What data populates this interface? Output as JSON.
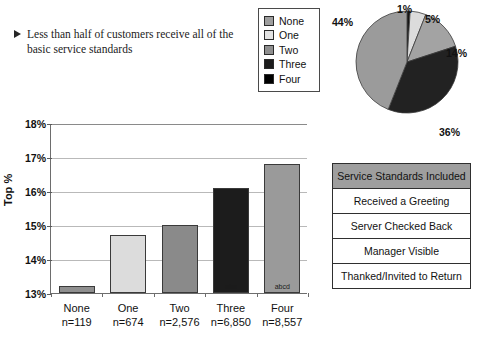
{
  "callout": {
    "bullet_icon": "triangle-right-icon",
    "text": "Less than half of customers receive all of the basic service standards"
  },
  "legend": {
    "items": [
      {
        "label": "None",
        "color": "#9e9e9e"
      },
      {
        "label": "One",
        "color": "#e2e2e2"
      },
      {
        "label": "Two",
        "color": "#8f8f8f"
      },
      {
        "label": "Three",
        "color": "#1c1c1c"
      },
      {
        "label": "Four",
        "color": "#000000"
      }
    ]
  },
  "table": {
    "header": "Service Standards Included",
    "header_bg": "#9e9e9e",
    "rows": [
      "Received a Greeting",
      "Server Checked Back",
      "Manager Visible",
      "Thanked/Invited to Return"
    ]
  },
  "chart_data": [
    {
      "type": "bar",
      "title": "",
      "xlabel": "",
      "ylabel": "Top %",
      "ylim": [
        13,
        18
      ],
      "ytick_labels": [
        "13%",
        "14%",
        "15%",
        "16%",
        "17%",
        "18%"
      ],
      "yticks": [
        13,
        14,
        15,
        16,
        17,
        18
      ],
      "grid": true,
      "categories": [
        "None",
        "One",
        "Two",
        "Three",
        "Four"
      ],
      "category_sublabels": [
        "n=119",
        "n=674",
        "n=2,576",
        "n=6,850",
        "n=8,557"
      ],
      "values": [
        13.2,
        14.7,
        15.0,
        16.1,
        16.8
      ],
      "bar_colors": [
        "#8f8f8f",
        "#dcdcdc",
        "#8a8a8a",
        "#1c1c1c",
        "#9a9a9a"
      ],
      "annotations": [
        "",
        "",
        "",
        "abc",
        "abcd"
      ]
    },
    {
      "type": "pie",
      "title": "",
      "legend_position": "left",
      "labels": [
        "None",
        "One",
        "Two",
        "Three",
        "Four"
      ],
      "values": [
        1,
        5,
        14,
        36,
        44
      ],
      "value_labels": [
        "1%",
        "5%",
        "14%",
        "36%",
        "44%"
      ],
      "colors": [
        "#141414",
        "#dcdcdc",
        "#a3a3a3",
        "#222222",
        "#9b9b9b"
      ]
    }
  ]
}
